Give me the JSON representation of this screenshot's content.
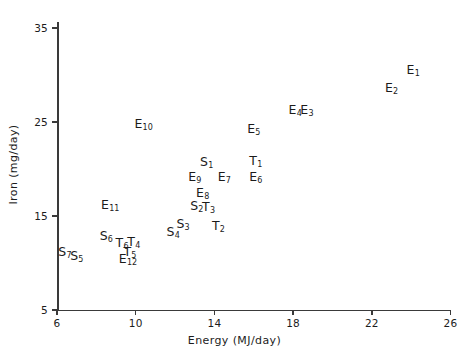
{
  "chart_data": {
    "type": "scatter",
    "title": "",
    "xlabel": "Energy (MJ/day)",
    "ylabel": "Iron (mg/day)",
    "xlim": [
      6,
      26
    ],
    "ylim": [
      5,
      35
    ],
    "xticks": [
      6,
      10,
      14,
      18,
      22,
      26
    ],
    "yticks": [
      5,
      15,
      25,
      35
    ],
    "xtick_labels": [
      "6",
      "10",
      "14",
      "18",
      "22",
      "26"
    ],
    "ytick_labels": [
      "5",
      "15",
      "25",
      "35"
    ],
    "grid": false,
    "legend": false,
    "marker_style": "text-label",
    "points": [
      {
        "label": "E",
        "sub": "1",
        "x": 24.1,
        "y": 30.5
      },
      {
        "label": "E",
        "sub": "2",
        "x": 23.0,
        "y": 28.6
      },
      {
        "label": "E",
        "sub": "3",
        "x": 18.7,
        "y": 26.3
      },
      {
        "label": "E",
        "sub": "4",
        "x": 18.1,
        "y": 26.3
      },
      {
        "label": "E",
        "sub": "5",
        "x": 16.0,
        "y": 24.3
      },
      {
        "label": "E",
        "sub": "6",
        "x": 16.1,
        "y": 19.1
      },
      {
        "label": "E",
        "sub": "7",
        "x": 14.5,
        "y": 19.2
      },
      {
        "label": "E",
        "sub": "8",
        "x": 13.4,
        "y": 17.5
      },
      {
        "label": "E",
        "sub": "9",
        "x": 13.0,
        "y": 19.2
      },
      {
        "label": "E",
        "sub": "10",
        "x": 10.4,
        "y": 24.8
      },
      {
        "label": "E",
        "sub": "11",
        "x": 8.7,
        "y": 16.2
      },
      {
        "label": "E",
        "sub": "12",
        "x": 9.6,
        "y": 10.4
      },
      {
        "label": "S",
        "sub": "1",
        "x": 13.6,
        "y": 20.7
      },
      {
        "label": "S",
        "sub": "2",
        "x": 13.1,
        "y": 16.1
      },
      {
        "label": "S",
        "sub": "3",
        "x": 12.4,
        "y": 14.1
      },
      {
        "label": "S",
        "sub": "4",
        "x": 11.9,
        "y": 13.3
      },
      {
        "label": "S",
        "sub": "5",
        "x": 7.0,
        "y": 10.7
      },
      {
        "label": "S",
        "sub": "6",
        "x": 8.5,
        "y": 12.9
      },
      {
        "label": "S",
        "sub": "7",
        "x": 6.4,
        "y": 11.2
      },
      {
        "label": "T",
        "sub": "1",
        "x": 16.1,
        "y": 20.8
      },
      {
        "label": "T",
        "sub": "2",
        "x": 14.2,
        "y": 13.9
      },
      {
        "label": "T",
        "sub": "3",
        "x": 13.7,
        "y": 16.0
      },
      {
        "label": "T",
        "sub": "4",
        "x": 9.9,
        "y": 12.2
      },
      {
        "label": "T",
        "sub": "5",
        "x": 9.7,
        "y": 11.2
      },
      {
        "label": "T",
        "sub": "6",
        "x": 9.3,
        "y": 12.1
      }
    ]
  },
  "colors": {
    "axis": "#3a3a3a",
    "text": "#1b1b1b",
    "background": "#ffffff"
  }
}
